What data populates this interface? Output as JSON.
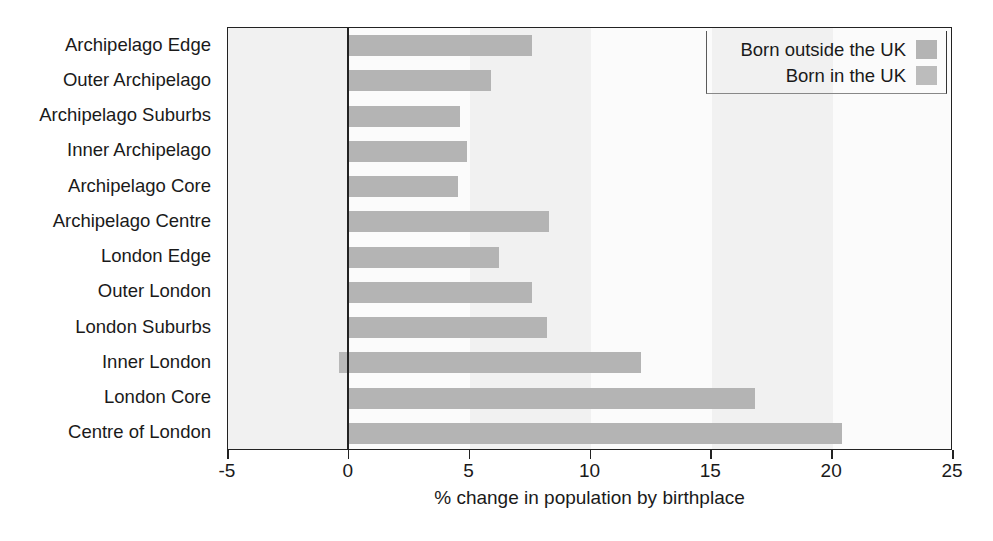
{
  "chart_data": {
    "type": "bar",
    "orientation": "horizontal",
    "title": "",
    "xlabel": "% change in population by birthplace",
    "ylabel": "",
    "xlim": [
      -5,
      25
    ],
    "xticks": [
      -5,
      0,
      5,
      10,
      15,
      20,
      25
    ],
    "xtick_labels": [
      "-5",
      "0",
      "5",
      "10",
      "15",
      "20",
      "25"
    ],
    "grid": false,
    "zero_line": true,
    "legend_position": "top-right",
    "categories": [
      "Archipelago Edge",
      "Outer Archipelago",
      "Archipelago Suburbs",
      "Inner Archipelago",
      "Archipelago Core",
      "Archipelago Centre",
      "London Edge",
      "Outer London",
      "London Suburbs",
      "Inner London",
      "London Core",
      "Centre of London"
    ],
    "series": [
      {
        "name": "Born outside the UK",
        "color": "#b4b4b4",
        "values": [
          7.6,
          5.9,
          4.6,
          4.9,
          4.5,
          8.3,
          6.2,
          7.6,
          8.2,
          12.1,
          16.8,
          20.4
        ]
      },
      {
        "name": "Born in the UK",
        "color": "#b8b8b8",
        "values": [
          0.0,
          0.0,
          0.0,
          0.0,
          0.0,
          0.0,
          0.0,
          0.0,
          0.0,
          -0.4,
          0.0,
          0.0
        ]
      }
    ]
  },
  "legend": {
    "entries": [
      {
        "label": "Born outside the UK",
        "color": "#b4b4b4"
      },
      {
        "label": "Born in the UK",
        "color": "#bcbcbc"
      }
    ]
  },
  "axis": {
    "x_title": "% change in population by birthplace"
  }
}
